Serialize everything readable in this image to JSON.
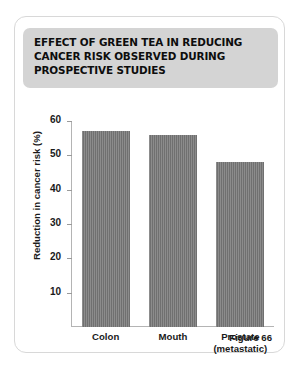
{
  "figure": {
    "title": "EFFECT OF GREEN TEA IN REDUCING CANCER RISK OBSERVED DURING PROSPECTIVE STUDIES",
    "caption": "Figure 66",
    "banner_color": "#d4d4d4",
    "bar_color": "#767676",
    "card_border_color": "#d8d8d8"
  },
  "chart_data": {
    "type": "bar",
    "title": "EFFECT OF GREEN TEA IN REDUCING CANCER RISK OBSERVED DURING PROSPECTIVE STUDIES",
    "categories": [
      "Colon",
      "Mouth",
      "Prostate (metastatic)"
    ],
    "category_lines": [
      [
        "Colon"
      ],
      [
        "Mouth"
      ],
      [
        "Prostate",
        "(metastatic)"
      ]
    ],
    "values": [
      57,
      56,
      48
    ],
    "xlabel": "",
    "ylabel": "Reduction in cancer risk (%)",
    "ylim": [
      0,
      60
    ],
    "yticks": [
      10,
      20,
      30,
      40,
      50,
      60
    ],
    "ytick_labels": [
      "10",
      "20",
      "30",
      "40",
      "50",
      "60"
    ],
    "grid": false,
    "legend": false
  }
}
